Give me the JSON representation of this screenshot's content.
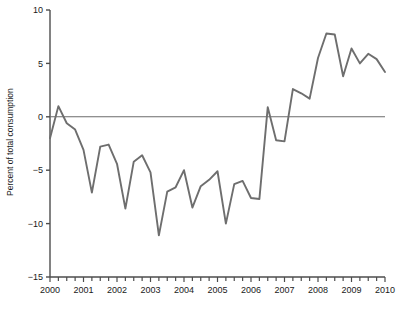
{
  "chart_data": {
    "type": "line",
    "title": "",
    "xlabel": "",
    "ylabel": "Percent of total consumption",
    "xlim": [
      2000,
      2010
    ],
    "ylim": [
      -15,
      10
    ],
    "yticks": [
      10,
      5,
      0,
      -5,
      -10,
      -15
    ],
    "ytick_labels": [
      "10",
      "5",
      "0",
      "−5",
      "−10",
      "−15"
    ],
    "xticks": [
      2000,
      2001,
      2002,
      2003,
      2004,
      2005,
      2006,
      2007,
      2008,
      2009,
      2010
    ],
    "xtick_labels": [
      "2000",
      "2001",
      "2002",
      "2003",
      "2004",
      "2005",
      "2006",
      "2007",
      "2008",
      "2009",
      "2010"
    ],
    "minor_xtick_interval": 0.25,
    "grid": false,
    "legend": "none",
    "zero_line": 0,
    "line_color": "#6e6e6e",
    "axis_color": "#4d4d4d",
    "series": [
      {
        "name": "Percent of total consumption",
        "x": [
          2000.0,
          2000.25,
          2000.5,
          2000.75,
          2001.0,
          2001.25,
          2001.5,
          2001.75,
          2002.0,
          2002.25,
          2002.5,
          2002.75,
          2003.0,
          2003.25,
          2003.5,
          2003.75,
          2004.0,
          2004.25,
          2004.5,
          2004.75,
          2005.0,
          2005.25,
          2005.5,
          2005.75,
          2006.0,
          2006.25,
          2006.5,
          2006.75,
          2007.0,
          2007.25,
          2007.5,
          2007.75,
          2008.0,
          2008.25,
          2008.5,
          2008.75,
          2009.0,
          2009.25,
          2009.5,
          2009.75,
          2010.0
        ],
        "values": [
          -2.0,
          1.0,
          -0.6,
          -1.2,
          -3.1,
          -7.1,
          -2.8,
          -2.6,
          -4.4,
          -8.6,
          -4.2,
          -3.6,
          -5.2,
          -11.1,
          -7.0,
          -6.6,
          -5.0,
          -8.5,
          -6.5,
          -5.9,
          -5.1,
          -10.0,
          -6.3,
          -6.0,
          -7.6,
          -7.7,
          0.9,
          -2.2,
          -2.3,
          2.6,
          2.2,
          1.7,
          5.5,
          7.8,
          7.7,
          3.8,
          6.4,
          5.0,
          5.9,
          5.4,
          4.2
        ]
      }
    ]
  }
}
